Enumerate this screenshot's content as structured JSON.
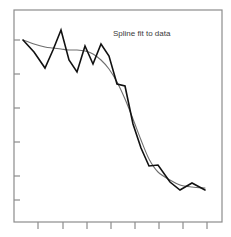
{
  "figure": {
    "background_color": "#ffffff",
    "edge_fragment": {
      "name": "left-edge-grey-block",
      "color": "#9a9a9a"
    }
  },
  "chart_data": {
    "type": "line",
    "title": "Spline fit to data",
    "xlabel": "",
    "ylabel": "",
    "grid": false,
    "legend": "none",
    "xlim": [
      0,
      16
    ],
    "ylim": [
      0,
      10
    ],
    "axis_frame": {
      "left": 14,
      "right": 222,
      "top": 10,
      "bottom": 222,
      "color": "#8c8c8c"
    },
    "xticks": [
      1,
      3,
      5,
      7,
      9,
      11,
      13,
      15
    ],
    "xticklabels": [
      "",
      "",
      "",
      "",
      "",
      "",
      "",
      ""
    ],
    "yticks": [
      1.5,
      3.0,
      4.5,
      6.0,
      7.5,
      8.6
    ],
    "yticklabels": [
      "",
      "",
      "",
      "",
      "",
      ""
    ],
    "series": [
      {
        "name": "data",
        "style": "polyline",
        "color": "#111111",
        "linewidth": 1.6,
        "x": [
          0.6,
          1.6,
          2.6,
          3.3,
          4.0,
          4.7,
          5.4,
          6.1,
          6.8,
          7.5,
          8.2,
          8.9,
          9.6,
          10.3,
          11.0,
          11.7,
          12.4,
          13.1,
          13.8,
          14.5,
          15.3
        ],
        "y": [
          8.55,
          7.95,
          7.15,
          8.05,
          9.05,
          7.55,
          6.95,
          8.25,
          7.35,
          8.35,
          7.75,
          6.35,
          6.25,
          4.35,
          3.15,
          2.25,
          2.3,
          1.45,
          1.05,
          1.4,
          1.05
        ],
        "y_pixels": [
          40,
          52,
          68,
          50,
          30,
          60,
          72,
          46,
          64,
          44,
          56,
          84,
          86,
          124,
          148,
          166,
          165,
          182,
          190,
          183,
          190
        ],
        "x_pixels": [
          23,
          34,
          45,
          53,
          61,
          69,
          77,
          85,
          93,
          101,
          109,
          117,
          125,
          133,
          141,
          149,
          158,
          170,
          180,
          192,
          205
        ]
      },
      {
        "name": "spline fit",
        "style": "smooth",
        "color": "#6e6e6e",
        "linewidth": 1.1,
        "x": [
          0.6,
          1.6,
          2.6,
          3.3,
          4.0,
          4.7,
          5.4,
          6.1,
          6.8,
          7.5,
          8.2,
          8.9,
          9.6,
          10.3,
          11.0,
          11.7,
          12.4,
          13.1,
          13.8,
          14.5,
          15.3
        ],
        "y": [
          8.55,
          8.35,
          8.2,
          8.15,
          8.1,
          8.05,
          8.05,
          8.0,
          7.85,
          7.55,
          7.1,
          6.45,
          5.6,
          4.6,
          3.55,
          2.6,
          1.95,
          1.55,
          1.3,
          1.2,
          1.15
        ],
        "y_pixels": [
          40,
          44,
          47,
          48,
          49,
          50,
          50,
          51,
          54,
          60,
          69,
          82,
          99,
          119,
          140,
          159,
          172,
          180,
          185,
          187,
          188
        ],
        "x_pixels": [
          23,
          34,
          45,
          53,
          61,
          69,
          77,
          85,
          93,
          101,
          109,
          117,
          125,
          133,
          141,
          149,
          158,
          170,
          180,
          192,
          205
        ]
      }
    ],
    "annotations": [
      {
        "name": "title-annotation",
        "text": "Spline fit to data",
        "x_pixel": 113,
        "y_pixel": 36
      }
    ]
  }
}
